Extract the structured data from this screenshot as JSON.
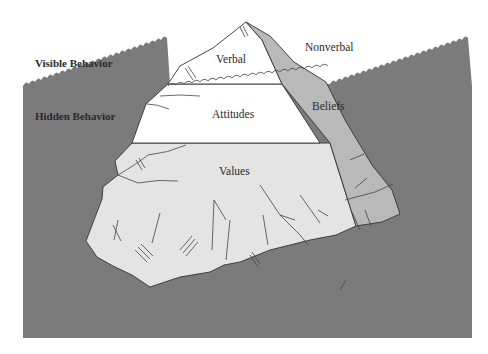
{
  "diagram": {
    "side_labels": {
      "visible": "Visible Behavior",
      "hidden": "Hidden Behavior"
    },
    "regions": {
      "verbal": "Verbal",
      "nonverbal": "Nonverbal",
      "attitudes": "Attitudes",
      "beliefs": "Beliefs",
      "values": "Values"
    },
    "colors": {
      "water": "#7b7b7b",
      "ice_white": "#ffffff",
      "ice_light": "#e4e4e4",
      "ice_mid": "#b9b9b9",
      "outline": "#333333",
      "text": "#2a2a2a"
    }
  }
}
